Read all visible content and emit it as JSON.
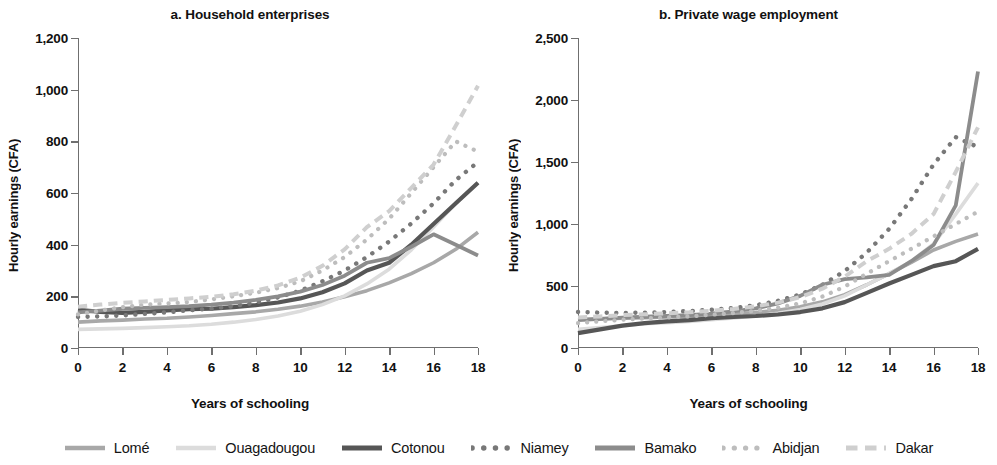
{
  "figure": {
    "ylabel": "Hourly earnings (CFA)",
    "xlabel": "Years of schooling"
  },
  "panels": [
    {
      "title": "a. Household enterprises"
    },
    {
      "title": "b. Private wage employment"
    }
  ],
  "legend": {
    "items": [
      {
        "label": "Lomé",
        "style": "solid",
        "color": "#a8a8a8",
        "width": 3.6
      },
      {
        "label": "Ouagadougou",
        "style": "solid",
        "color": "#dcdcdc",
        "width": 3.6
      },
      {
        "label": "Cotonou",
        "style": "solid",
        "color": "#565656",
        "width": 4.2
      },
      {
        "label": "Niamey",
        "style": "dotted",
        "color": "#787878",
        "width": 4.4
      },
      {
        "label": "Bamako",
        "style": "solid",
        "color": "#8c8c8c",
        "width": 3.8
      },
      {
        "label": "Abidjan",
        "style": "dotted",
        "color": "#bdbdbd",
        "width": 4.2
      },
      {
        "label": "Dakar",
        "style": "dashed",
        "color": "#cfcfcf",
        "width": 4.0
      }
    ]
  },
  "chart_data": [
    {
      "type": "line",
      "title": "a. Household enterprises",
      "xlabel": "Years of schooling",
      "ylabel": "Hourly earnings (CFA)",
      "xlim": [
        0,
        18
      ],
      "ylim": [
        0,
        1200
      ],
      "xticks": [
        0,
        2,
        4,
        6,
        8,
        10,
        12,
        14,
        16,
        18
      ],
      "yticks": [
        0,
        200,
        400,
        600,
        800,
        1000,
        1200
      ],
      "ytick_labels": [
        "0",
        "200",
        "400",
        "600",
        "800",
        "1,000",
        "1,200"
      ],
      "grid": false,
      "legend_position": "bottom",
      "x": [
        0,
        1,
        2,
        3,
        4,
        5,
        6,
        7,
        8,
        9,
        10,
        11,
        12,
        13,
        14,
        15,
        16,
        17,
        18
      ],
      "series": [
        {
          "name": "Lomé",
          "values": [
            100,
            105,
            108,
            112,
            115,
            120,
            126,
            133,
            140,
            150,
            162,
            178,
            198,
            222,
            252,
            288,
            330,
            382,
            448
          ]
        },
        {
          "name": "Ouagadougou",
          "values": [
            72,
            74,
            76,
            79,
            82,
            86,
            92,
            100,
            110,
            124,
            142,
            168,
            202,
            248,
            305,
            380,
            468,
            560,
            640
          ]
        },
        {
          "name": "Cotonou",
          "values": [
            148,
            140,
            136,
            140,
            146,
            150,
            152,
            158,
            166,
            176,
            192,
            216,
            250,
            300,
            330,
            400,
            480,
            560,
            640
          ]
        },
        {
          "name": "Niamey",
          "values": [
            120,
            122,
            126,
            132,
            138,
            146,
            152,
            162,
            176,
            196,
            222,
            258,
            300,
            352,
            412,
            482,
            560,
            650,
            720
          ]
        },
        {
          "name": "Bamako",
          "values": [
            138,
            145,
            152,
            155,
            158,
            162,
            168,
            176,
            186,
            200,
            218,
            244,
            280,
            330,
            348,
            392,
            440,
            400,
            358
          ]
        },
        {
          "name": "Abidjan",
          "values": [
            130,
            145,
            158,
            168,
            172,
            178,
            188,
            200,
            214,
            232,
            258,
            300,
            352,
            420,
            500,
            600,
            700,
            800,
            760
          ]
        },
        {
          "name": "Dakar",
          "values": [
            160,
            168,
            175,
            180,
            186,
            192,
            198,
            208,
            222,
            242,
            272,
            318,
            382,
            468,
            530,
            620,
            710,
            860,
            1015
          ]
        }
      ]
    },
    {
      "type": "line",
      "title": "b. Private wage employment",
      "xlabel": "Years of schooling",
      "ylabel": "Hourly earnings (CFA)",
      "xlim": [
        0,
        18
      ],
      "ylim": [
        0,
        2500
      ],
      "xticks": [
        0,
        2,
        4,
        6,
        8,
        10,
        12,
        14,
        16,
        18
      ],
      "yticks": [
        0,
        500,
        1000,
        1500,
        2000,
        2500
      ],
      "ytick_labels": [
        "0",
        "500",
        "1,000",
        "1,500",
        "2,000",
        "2,500"
      ],
      "grid": false,
      "legend_position": "bottom",
      "x": [
        0,
        1,
        2,
        3,
        4,
        5,
        6,
        7,
        8,
        9,
        10,
        11,
        12,
        13,
        14,
        15,
        16,
        17,
        18
      ],
      "series": [
        {
          "name": "Lomé",
          "values": [
            230,
            235,
            240,
            245,
            250,
            255,
            262,
            272,
            286,
            305,
            332,
            372,
            430,
            510,
            600,
            690,
            790,
            860,
            920
          ]
        },
        {
          "name": "Ouagadougou",
          "values": [
            150,
            165,
            180,
            195,
            205,
            215,
            228,
            242,
            258,
            280,
            310,
            355,
            420,
            510,
            600,
            700,
            840,
            1080,
            1330
          ]
        },
        {
          "name": "Cotonou",
          "values": [
            120,
            150,
            180,
            200,
            215,
            225,
            240,
            250,
            258,
            270,
            290,
            320,
            370,
            445,
            520,
            590,
            660,
            700,
            800
          ]
        },
        {
          "name": "Niamey",
          "values": [
            290,
            285,
            282,
            285,
            290,
            298,
            308,
            322,
            345,
            380,
            432,
            510,
            620,
            770,
            960,
            1200,
            1480,
            1700,
            1620
          ]
        },
        {
          "name": "Bamako",
          "values": [
            225,
            235,
            245,
            252,
            258,
            265,
            278,
            295,
            320,
            360,
            420,
            510,
            555,
            570,
            590,
            700,
            830,
            1150,
            2230
          ]
        },
        {
          "name": "Abidjan",
          "values": [
            200,
            215,
            228,
            238,
            246,
            255,
            268,
            282,
            300,
            325,
            360,
            415,
            495,
            600,
            700,
            800,
            900,
            1000,
            1100
          ]
        },
        {
          "name": "Dakar",
          "values": [
            245,
            255,
            265,
            272,
            280,
            288,
            300,
            315,
            336,
            366,
            410,
            478,
            575,
            700,
            800,
            920,
            1080,
            1420,
            1780
          ]
        }
      ]
    }
  ]
}
